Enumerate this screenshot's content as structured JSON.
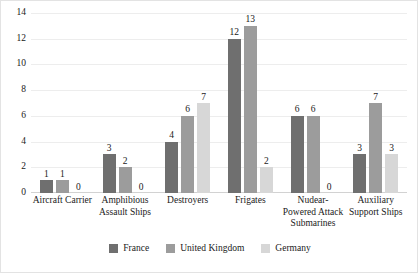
{
  "chart_data": {
    "type": "bar",
    "title": "",
    "xlabel": "",
    "ylabel": "",
    "ylim": [
      0,
      14
    ],
    "yticks": [
      0,
      2,
      4,
      6,
      8,
      10,
      12,
      14
    ],
    "grid": true,
    "legend_position": "bottom-center",
    "categories": [
      "Aircraft Carrier",
      "Amphibious Assault Ships",
      "Destroyers",
      "Frigates",
      "Nudear-Powered Attack Submarines",
      "Auxiliary Support Ships"
    ],
    "series": [
      {
        "name": "France",
        "color": "#6f6f6f",
        "values": [
          1,
          3,
          4,
          12,
          6,
          3
        ]
      },
      {
        "name": "United Kingdom",
        "color": "#9c9c9c",
        "values": [
          1,
          2,
          6,
          13,
          6,
          7
        ]
      },
      {
        "name": "Germany",
        "color": "#d7d7d7",
        "values": [
          0,
          0,
          7,
          2,
          0,
          3
        ]
      }
    ],
    "data_labels": {
      "Aircraft Carrier": [
        "1",
        "1",
        "0"
      ],
      "Amphibious Assault Ships": [
        "3",
        "2",
        "0"
      ],
      "Destroyers": [
        "4",
        "6",
        "7"
      ],
      "Frigates": [
        "12",
        "13",
        "2"
      ],
      "Nudear-Powered Attack Submarines": [
        "6",
        "6",
        "0"
      ],
      "Auxiliary Support Ships": [
        "3",
        "7",
        "3"
      ]
    }
  },
  "colors": {
    "background": "#ffffff",
    "gridline": "#ededed",
    "axis": "#d2d2d2",
    "border": "#e3e3e3",
    "text": "#1a1a1a"
  }
}
